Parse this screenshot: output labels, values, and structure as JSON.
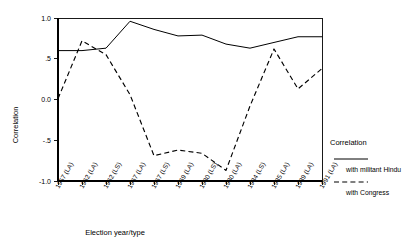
{
  "chart_data": {
    "type": "line",
    "title": "",
    "xlabel": "Election year/type",
    "ylabel": "Correlation",
    "ylim": [
      -1.0,
      1.0
    ],
    "ytick_labels": [
      "1.0",
      ".5",
      "0.0",
      "-.5",
      "-1.0"
    ],
    "ytick_values": [
      1.0,
      0.5,
      0.0,
      -0.5,
      -1.0
    ],
    "grid": false,
    "legend_position": "right",
    "categories": [
      "1957 (LA)",
      "1962 (LA)",
      "1962 (LS)",
      "1967 (LA)",
      "1967 (LS)",
      "1969 (LA)",
      "1980 (LS)",
      "1980 (LA)",
      "1984 (LS)",
      "1985 (LA)",
      "1989 (LA)",
      "1991 (LA)"
    ],
    "series": [
      {
        "name": "with militant Hindu",
        "style": "solid",
        "values": [
          0.6,
          0.6,
          0.63,
          0.96,
          0.86,
          0.78,
          0.79,
          0.68,
          0.63,
          0.7,
          0.77,
          0.77
        ]
      },
      {
        "name": "with Congress",
        "style": "dashed",
        "values": [
          0.01,
          0.72,
          0.55,
          0.06,
          -0.69,
          -0.62,
          -0.66,
          -0.87,
          -0.08,
          0.62,
          0.13,
          0.38
        ]
      }
    ]
  },
  "axes": {
    "y_title": "Correlation",
    "x_title": "Election year/type"
  },
  "legend": {
    "title": "Correlation",
    "entries": [
      {
        "label": "with militant Hindu",
        "style": "solid"
      },
      {
        "label": "with Congress",
        "style": "dashed"
      }
    ]
  }
}
